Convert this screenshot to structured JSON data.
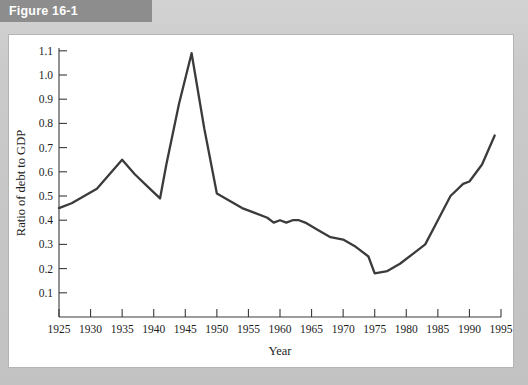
{
  "figure": {
    "banner_label": "Figure 16-1"
  },
  "chart_data": {
    "type": "line",
    "title": "",
    "xlabel": "Year",
    "ylabel": "Ratio of debt to GDP",
    "xlim": [
      1925,
      1995
    ],
    "ylim": [
      0,
      1.15
    ],
    "grid": false,
    "legend": "none",
    "line_color": "#3b3b3b",
    "xticks": [
      1925,
      1930,
      1935,
      1940,
      1945,
      1950,
      1955,
      1960,
      1965,
      1970,
      1975,
      1980,
      1985,
      1990,
      1995
    ],
    "xtick_labels": [
      "1925",
      "1930",
      "1935",
      "1940",
      "1945",
      "1950",
      "1955",
      "1960",
      "1965",
      "1970",
      "1975",
      "1980",
      "1985",
      "1990",
      "1995"
    ],
    "yticks": [
      0.1,
      0.2,
      0.3,
      0.4,
      0.5,
      0.6,
      0.7,
      0.8,
      0.9,
      1.0,
      1.1
    ],
    "ytick_labels": [
      "0.1",
      "0.2",
      "0.3",
      "0.4",
      "0.5",
      "0.6",
      "0.7",
      "0.8",
      "0.9",
      "1.0",
      "1.1"
    ],
    "series": [
      {
        "name": "Ratio of debt to GDP",
        "x": [
          1925,
          1927,
          1929,
          1931,
          1933,
          1935,
          1937,
          1939,
          1941,
          1942,
          1944,
          1946,
          1948,
          1950,
          1952,
          1954,
          1956,
          1958,
          1959,
          1960,
          1961,
          1962,
          1963,
          1964,
          1966,
          1968,
          1970,
          1972,
          1974,
          1975,
          1977,
          1979,
          1981,
          1983,
          1985,
          1987,
          1989,
          1990,
          1992,
          1994
        ],
        "y": [
          0.45,
          0.47,
          0.5,
          0.53,
          0.59,
          0.65,
          0.59,
          0.54,
          0.49,
          0.63,
          0.88,
          1.09,
          0.78,
          0.51,
          0.48,
          0.45,
          0.43,
          0.41,
          0.39,
          0.4,
          0.39,
          0.4,
          0.4,
          0.39,
          0.36,
          0.33,
          0.32,
          0.29,
          0.25,
          0.18,
          0.19,
          0.22,
          0.26,
          0.3,
          0.4,
          0.5,
          0.55,
          0.56,
          0.63,
          0.75
        ]
      }
    ]
  }
}
